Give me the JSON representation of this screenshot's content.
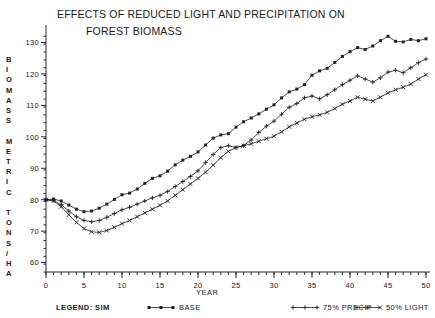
{
  "chart_data": {
    "type": "line",
    "title": "EFFECTS OF REDUCED LIGHT AND PRECIPITATION ON",
    "title_line2": "FOREST BIOMASS",
    "xlabel": "YEAR",
    "ylabel": "BIOMASS METRIC TONS / HA",
    "ylabel_stack": [
      "B",
      "I",
      "O",
      "M",
      "A",
      "S",
      "S",
      "",
      "M",
      "E",
      "T",
      "R",
      "I",
      "C",
      "",
      "T",
      "O",
      "N",
      "S",
      "/",
      "H",
      "A"
    ],
    "xlim": [
      0,
      50
    ],
    "ylim": [
      57,
      134
    ],
    "xticks": [
      0,
      5,
      10,
      15,
      20,
      25,
      30,
      35,
      40,
      45,
      50
    ],
    "xtick_labels": [
      "0",
      "5",
      "10",
      "15",
      "20",
      "25",
      "30",
      "35",
      "40",
      "45",
      "50"
    ],
    "yticks": [
      60,
      70,
      80,
      90,
      100,
      110,
      120,
      130
    ],
    "ytick_labels": [
      "60",
      "70",
      "80",
      "90",
      "100",
      "110",
      "120",
      "130"
    ],
    "x_minor_step": 1,
    "y_minor_step": 2.5,
    "grid": false,
    "legend_position": "below-axis",
    "legend_title": "LEGEND:  SIM",
    "x": [
      0,
      1,
      2,
      3,
      4,
      5,
      6,
      7,
      8,
      9,
      10,
      11,
      12,
      13,
      14,
      15,
      16,
      17,
      18,
      19,
      20,
      21,
      22,
      23,
      24,
      25,
      26,
      27,
      28,
      29,
      30,
      31,
      32,
      33,
      34,
      35,
      36,
      37,
      38,
      39,
      40,
      41,
      42,
      43,
      44,
      45,
      46,
      47,
      48,
      49,
      50
    ],
    "series": [
      {
        "name": "BASE",
        "marker": "filled-square",
        "values": [
          80,
          80.2,
          79.6,
          78.3,
          77,
          76.2,
          76.4,
          77.3,
          78.6,
          80.1,
          81.6,
          82.1,
          83.4,
          85.2,
          86.8,
          87.6,
          89.1,
          91.1,
          92.6,
          93.8,
          95.2,
          97.4,
          99.6,
          100.6,
          101,
          103.1,
          104.8,
          106,
          107.3,
          108.8,
          110.2,
          112.4,
          114.3,
          115.2,
          116.6,
          119.6,
          121,
          121.8,
          123.7,
          125.6,
          127.1,
          128.4,
          127.8,
          128.9,
          130.6,
          132,
          130.4,
          130.2,
          131,
          130.6,
          131.2
        ]
      },
      {
        "name": "75% PRECIP",
        "marker": "plus",
        "values": [
          80,
          79.8,
          78.4,
          76.4,
          74.6,
          73.4,
          73,
          73.4,
          74.4,
          75.6,
          76.8,
          77.6,
          78.6,
          79.6,
          80.6,
          81.4,
          82.6,
          84.2,
          85.8,
          87.4,
          89.2,
          91.8,
          94.4,
          96.6,
          97.2,
          96.6,
          97.2,
          99,
          101.4,
          103.4,
          105,
          107.2,
          109.4,
          110.6,
          112.4,
          113,
          112.1,
          113.4,
          115,
          116.6,
          118,
          119.4,
          118.4,
          117.4,
          118.8,
          120.6,
          121.2,
          120.4,
          122,
          123.6,
          124.8
        ]
      },
      {
        "name": "50% LIGHT",
        "marker": "x-cross",
        "values": [
          80,
          79.6,
          77.8,
          75.2,
          72.8,
          70.8,
          69.8,
          69.6,
          70.2,
          71.2,
          72.4,
          73.4,
          74.6,
          75.8,
          77,
          78.2,
          79.6,
          81.4,
          83.2,
          85,
          86.8,
          88.8,
          91,
          93.4,
          95.4,
          96.6,
          97.2,
          97.8,
          98.6,
          99.4,
          100.2,
          101.6,
          103.2,
          104.4,
          105.6,
          106.4,
          107,
          107.8,
          109,
          110.4,
          111.4,
          112.6,
          112,
          111.4,
          112.6,
          114,
          115,
          115.8,
          116.8,
          118.4,
          119.8
        ]
      }
    ],
    "legend": [
      {
        "label": "BASE",
        "marker": "filled-square"
      },
      {
        "label": "75% PRECIP",
        "marker": "plus"
      },
      {
        "label": "50% LIGHT",
        "marker": "x-cross"
      }
    ],
    "colors": {
      "ink": "#222222",
      "background": "#ffffff"
    }
  }
}
